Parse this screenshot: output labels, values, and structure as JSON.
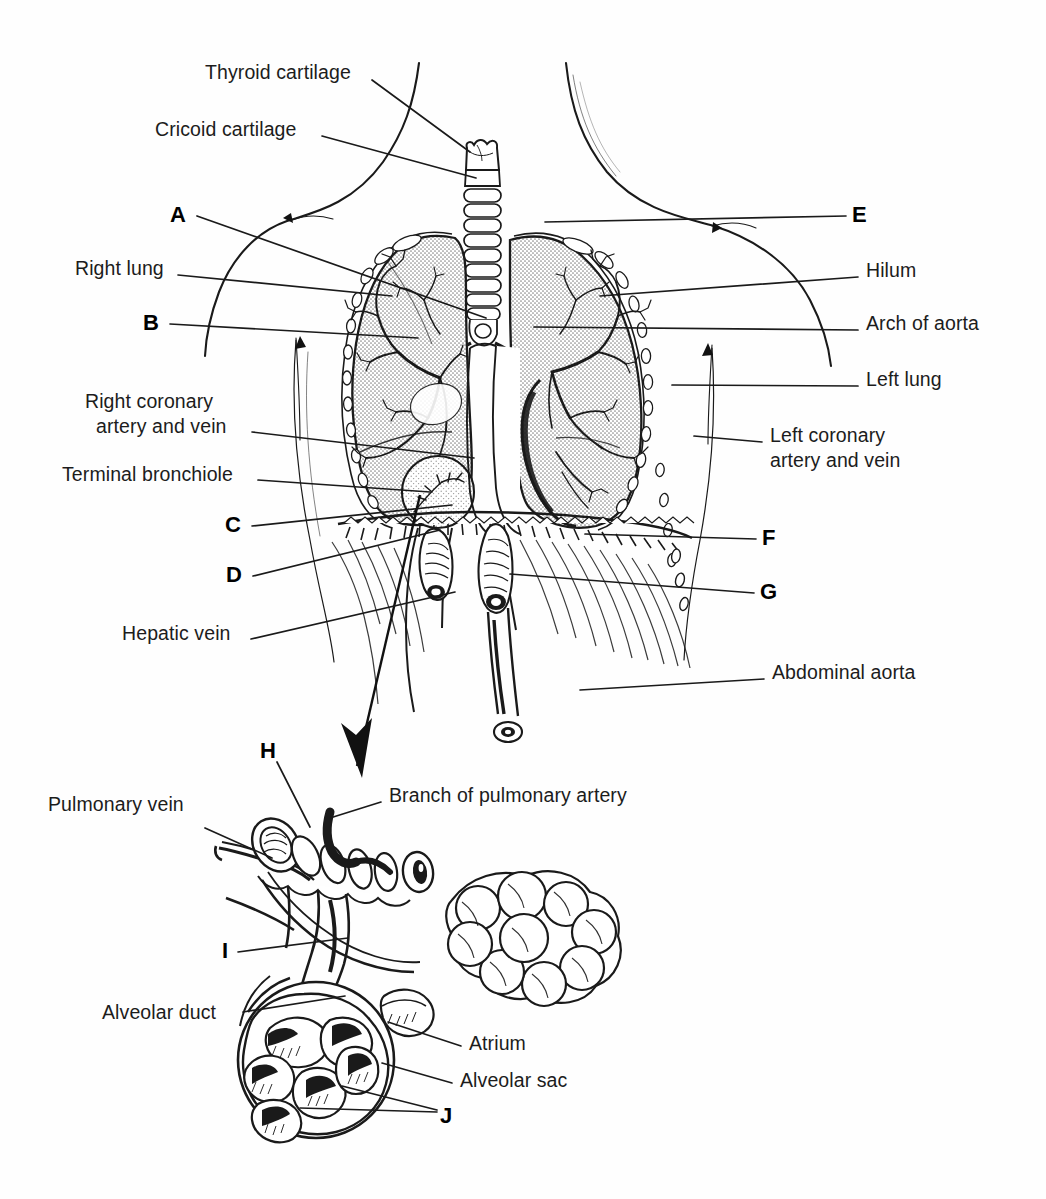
{
  "figure": {
    "background_color": "#fefefe",
    "ink_color": "#1a1a1a",
    "lung_fill_color": "#d8d8d8"
  },
  "upper_diagram": {
    "name": "thorax-overview",
    "labels_left": [
      {
        "id": "thyroid-cartilage",
        "text": "Thyroid cartilage",
        "x": 205,
        "y": 60,
        "align": "left",
        "leader": [
          [
            372,
            80
          ],
          [
            470,
            152
          ]
        ]
      },
      {
        "id": "cricoid-cartilage",
        "text": "Cricoid cartilage",
        "x": 155,
        "y": 117,
        "align": "left",
        "leader": [
          [
            322,
            136
          ],
          [
            476,
            178
          ]
        ]
      },
      {
        "id": "right-lung",
        "text": "Right lung",
        "x": 75,
        "y": 256,
        "align": "left",
        "leader": [
          [
            178,
            275
          ],
          [
            392,
            296
          ]
        ]
      },
      {
        "id": "right-coronary",
        "text": "Right coronary\n  artery and vein",
        "x": 85,
        "y": 389,
        "align": "left",
        "leader": [
          [
            252,
            432
          ],
          [
            474,
            458
          ]
        ]
      },
      {
        "id": "terminal-bronchiole",
        "text": "Terminal bronchiole",
        "x": 62,
        "y": 462,
        "align": "left",
        "leader": [
          [
            258,
            480
          ],
          [
            430,
            492
          ]
        ]
      },
      {
        "id": "hepatic-vein",
        "text": "Hepatic vein",
        "x": 122,
        "y": 621,
        "align": "left",
        "leader": [
          [
            251,
            639
          ],
          [
            455,
            592
          ]
        ]
      }
    ],
    "labels_right": [
      {
        "id": "hilum",
        "text": "Hilum",
        "x": 866,
        "y": 258,
        "align": "left",
        "leader": [
          [
            858,
            277
          ],
          [
            600,
            296
          ]
        ]
      },
      {
        "id": "arch-of-aorta",
        "text": "Arch of aorta",
        "x": 866,
        "y": 311,
        "align": "left",
        "leader": [
          [
            858,
            330
          ],
          [
            534,
            327
          ]
        ]
      },
      {
        "id": "left-lung",
        "text": "Left lung",
        "x": 866,
        "y": 367,
        "align": "left",
        "leader": [
          [
            858,
            386
          ],
          [
            672,
            385
          ]
        ]
      },
      {
        "id": "left-coronary",
        "text": "Left coronary\nartery and vein",
        "x": 770,
        "y": 423,
        "align": "left",
        "leader": [
          [
            762,
            442
          ],
          [
            694,
            436
          ]
        ]
      },
      {
        "id": "abdominal-aorta",
        "text": "Abdominal aorta",
        "x": 772,
        "y": 660,
        "align": "left",
        "leader": [
          [
            764,
            679
          ],
          [
            580,
            690
          ]
        ]
      }
    ],
    "keys": [
      {
        "id": "A",
        "text": "A",
        "x": 170,
        "y": 202,
        "leader": [
          [
            197,
            216
          ],
          [
            486,
            318
          ]
        ]
      },
      {
        "id": "B",
        "text": "B",
        "x": 143,
        "y": 310,
        "leader": [
          [
            170,
            324
          ],
          [
            418,
            338
          ]
        ]
      },
      {
        "id": "C",
        "text": "C",
        "x": 225,
        "y": 512,
        "leader": [
          [
            252,
            526
          ],
          [
            452,
            505
          ]
        ]
      },
      {
        "id": "D",
        "text": "D",
        "x": 226,
        "y": 562,
        "leader": [
          [
            253,
            576
          ],
          [
            440,
            530
          ]
        ]
      },
      {
        "id": "E",
        "text": "E",
        "x": 852,
        "y": 202,
        "leader": [
          [
            846,
            216
          ],
          [
            545,
            222
          ]
        ]
      },
      {
        "id": "F",
        "text": "F",
        "x": 762,
        "y": 525,
        "leader": [
          [
            756,
            539
          ],
          [
            585,
            534
          ]
        ]
      },
      {
        "id": "G",
        "text": "G",
        "x": 760,
        "y": 579,
        "leader": [
          [
            754,
            593
          ],
          [
            510,
            574
          ]
        ]
      }
    ]
  },
  "lower_diagram": {
    "name": "terminal-bronchiole-detail",
    "labels": [
      {
        "id": "pulmonary-vein",
        "text": "Pulmonary vein",
        "x": 48,
        "y": 792,
        "align": "left",
        "leader": [
          [
            205,
            828
          ],
          [
            272,
            858
          ]
        ]
      },
      {
        "id": "branch-of-pulmonary-artery",
        "text": "Branch of pulmonary artery",
        "x": 389,
        "y": 783,
        "align": "left",
        "leader": [
          [
            381,
            802
          ],
          [
            330,
            818
          ]
        ]
      },
      {
        "id": "alveolar-duct",
        "text": "Alveolar duct",
        "x": 102,
        "y": 1000,
        "align": "left",
        "leader": [
          [
            243,
            1012
          ],
          [
            345,
            996
          ]
        ]
      },
      {
        "id": "atrium",
        "text": "Atrium",
        "x": 469,
        "y": 1031,
        "align": "left",
        "leader": [
          [
            461,
            1046
          ],
          [
            388,
            1022
          ]
        ]
      },
      {
        "id": "alveolar-sac",
        "text": "Alveolar sac",
        "x": 460,
        "y": 1068,
        "align": "left",
        "leader": [
          [
            452,
            1083
          ],
          [
            382,
            1063
          ]
        ]
      }
    ],
    "keys": [
      {
        "id": "H",
        "text": "H",
        "x": 260,
        "y": 738,
        "leader": [
          [
            277,
            762
          ],
          [
            310,
            827
          ]
        ]
      },
      {
        "id": "I",
        "text": "I",
        "x": 222,
        "y": 938,
        "leader": [
          [
            238,
            952
          ],
          [
            348,
            938
          ]
        ]
      },
      {
        "id": "J",
        "text": "J",
        "x": 440,
        "y": 1103,
        "leader_multi": [
          [
            [
              437,
              1110
            ],
            [
              342,
              1086
            ]
          ],
          [
            [
              437,
              1112
            ],
            [
              300,
              1108
            ]
          ]
        ]
      }
    ],
    "magnifier_arrow": {
      "from": [
        420,
        495
      ],
      "to": [
        362,
        778
      ]
    }
  }
}
